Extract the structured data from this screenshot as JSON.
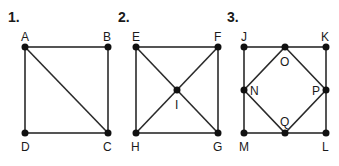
{
  "figures": [
    {
      "number": "1.",
      "points": {
        "A": "A",
        "B": "B",
        "C": "C",
        "D": "D"
      }
    },
    {
      "number": "2.",
      "points": {
        "E": "E",
        "F": "F",
        "G": "G",
        "H": "H",
        "I": "I"
      }
    },
    {
      "number": "3.",
      "points": {
        "J": "J",
        "K": "K",
        "L": "L",
        "M": "M",
        "N": "N",
        "O": "O",
        "P": "P",
        "Q": "Q"
      }
    }
  ],
  "colors": {
    "line": "#2b2b2b",
    "point": "#111111",
    "background": "#ffffff"
  }
}
